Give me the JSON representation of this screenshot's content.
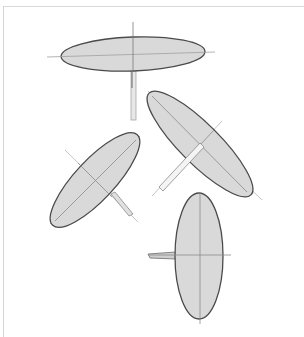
{
  "figure": {
    "colors": {
      "background": "#ffffff",
      "frame": "#d4d4d4",
      "fill": "#d9d9d9",
      "outline": "#4a4a4a",
      "axis": "#9a9a9a",
      "stick": "#8a8a8a"
    },
    "ellipses": [
      {
        "name": "top-horizontal",
        "cx": 133,
        "cy": 54,
        "rx": 72,
        "ry": 17,
        "rotation": -2
      },
      {
        "name": "right-tilted",
        "cx": 200,
        "cy": 144,
        "rx": 72,
        "ry": 20,
        "rotation": 45
      },
      {
        "name": "left-tilted",
        "cx": 95,
        "cy": 180,
        "rx": 62,
        "ry": 20,
        "rotation": -47
      },
      {
        "name": "bottom-vertical",
        "cx": 199,
        "cy": 256,
        "rx": 24,
        "ry": 63,
        "rotation": 0
      }
    ]
  }
}
